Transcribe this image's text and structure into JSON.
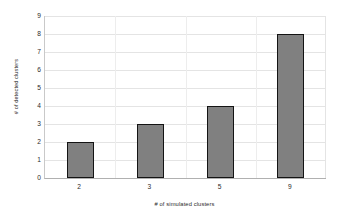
{
  "chart_data": {
    "type": "bar",
    "title": "",
    "categories": [
      "2",
      "3",
      "5",
      "9"
    ],
    "values": [
      2,
      3,
      4,
      8
    ],
    "series": [
      {
        "name": "# of detected clusters",
        "values": [
          2,
          3,
          4,
          8
        ]
      }
    ],
    "xlabel": "# of simulated clusters",
    "ylabel": "# of detected clusters",
    "ylim": [
      0,
      9
    ],
    "yticks": [
      0,
      1,
      2,
      3,
      4,
      5,
      6,
      7,
      8,
      9
    ],
    "ytick_labels": [
      "0",
      "1",
      "2",
      "3",
      "4",
      "5",
      "6",
      "7",
      "8",
      "9"
    ],
    "grid": true,
    "grid_axis": "y",
    "legend": false,
    "legend_position": "none",
    "bar_fill_color": "#808080",
    "bar_edge_color": "#141414",
    "gridline_color": "#e4e4e4",
    "background_color": "#ffffff",
    "text_color": "#2b2b2b"
  }
}
